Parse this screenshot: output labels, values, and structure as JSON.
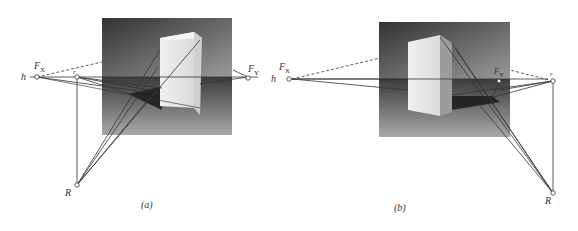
{
  "figure": {
    "panels": [
      {
        "id": "a",
        "caption": "(a)",
        "labels": {
          "horizon": "h",
          "vp_left": "F",
          "vp_left_sub": "X",
          "vp_right": "F",
          "vp_right_sub": "Y",
          "measure_point": "r",
          "station_point": "R"
        }
      },
      {
        "id": "b",
        "caption": "(b)",
        "labels": {
          "horizon": "h",
          "vp_left": "F",
          "vp_left_sub": "X",
          "vp_mid": "F",
          "vp_mid_sub": "Y",
          "measure_point": "r",
          "station_point": "R"
        }
      }
    ],
    "colors": {
      "background": "#ffffff",
      "line": "#333333",
      "scene_dark": "#3a3a3a",
      "scene_light": "#b5b5b5",
      "box_face": "#e4e4e4",
      "box_side": "#c9c9c9"
    }
  }
}
